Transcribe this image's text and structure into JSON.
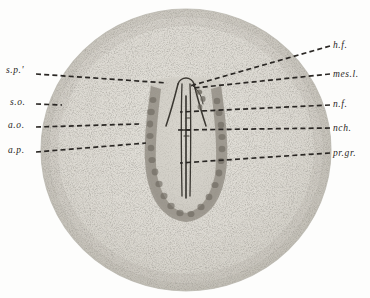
{
  "figure": {
    "kind": "histological-plate",
    "background_color": "#fdfdfc",
    "disc_color": "#dcdad3",
    "disc_edge_color": "#bdbab2",
    "shield_color": "#d2cfc7",
    "crescent_color": "#8d887e",
    "line_color": "#2a2724",
    "stipple_color": "#6a665e"
  },
  "labels_left": [
    {
      "id": "s-p-prime",
      "text": "s.p.'",
      "x": 6,
      "y": 66,
      "leader_from_x": 36,
      "leader_from_y": 74,
      "leader_to_x": 167,
      "leader_to_y": 83
    },
    {
      "id": "s-o",
      "text": "s.o.",
      "x": 10,
      "y": 98,
      "leader_from_x": 36,
      "leader_from_y": 104,
      "leader_to_x": 62,
      "leader_to_y": 105
    },
    {
      "id": "a-o",
      "text": "a.o.",
      "x": 8,
      "y": 121,
      "leader_from_x": 36,
      "leader_from_y": 127,
      "leader_to_x": 139,
      "leader_to_y": 124
    },
    {
      "id": "a-p",
      "text": "a.p.",
      "x": 8,
      "y": 146,
      "leader_from_x": 36,
      "leader_from_y": 152,
      "leader_to_x": 146,
      "leader_to_y": 143
    }
  ],
  "labels_right": [
    {
      "id": "h-f",
      "text": "h.f.",
      "x": 333,
      "y": 41,
      "leader_from_x": 330,
      "leader_from_y": 46,
      "leader_to_x": 190,
      "leader_to_y": 86
    },
    {
      "id": "mes-l",
      "text": "mes.l.",
      "x": 333,
      "y": 70,
      "leader_from_x": 330,
      "leader_from_y": 74,
      "leader_to_x": 194,
      "leader_to_y": 88
    },
    {
      "id": "n-f",
      "text": "n.f.",
      "x": 333,
      "y": 100,
      "leader_from_x": 330,
      "leader_from_y": 105,
      "leader_to_x": 180,
      "leader_to_y": 112
    },
    {
      "id": "nch",
      "text": "nch.",
      "x": 333,
      "y": 124,
      "leader_from_x": 330,
      "leader_from_y": 128,
      "leader_to_x": 178,
      "leader_to_y": 130
    },
    {
      "id": "pr-gr",
      "text": "pr.gr.",
      "x": 333,
      "y": 149,
      "leader_from_x": 330,
      "leader_from_y": 153,
      "leader_to_x": 180,
      "leader_to_y": 163
    }
  ]
}
